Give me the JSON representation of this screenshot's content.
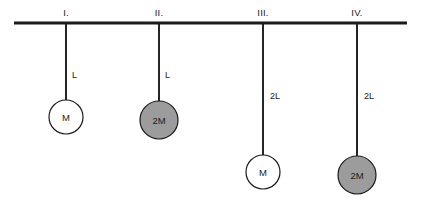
{
  "diagram": {
    "background_color": "#ffffff",
    "line_color": "#1a1a1a",
    "bob_white_color": "#ffffff",
    "bob_gray_color": "#9c9c9c",
    "width": 423,
    "height": 204
  },
  "ceiling": {
    "label": "ceiling",
    "x_start": 14,
    "x_end": 407,
    "y": 23,
    "thickness": 3.2
  },
  "pendulums": [
    {
      "id": "I",
      "roman_label": "I.",
      "roman_label_x": 66,
      "roman_label_y": 16,
      "rod_x": 66,
      "rod_top_y": 23,
      "rod_bottom_y": 100,
      "length_label": "L",
      "length_label_x": 72,
      "length_label_y": 78,
      "bob_label": "M",
      "bob_cx": 66,
      "bob_cy": 117,
      "bob_r": 17,
      "bob_fill": "white"
    },
    {
      "id": "II",
      "roman_label": "II.",
      "roman_label_x": 159,
      "roman_label_y": 16,
      "rod_x": 159,
      "rod_top_y": 23,
      "rod_bottom_y": 101,
      "length_label": "L",
      "length_label_x": 165,
      "length_label_y": 78,
      "bob_label": "2M",
      "bob_cx": 159,
      "bob_cy": 120,
      "bob_r": 19,
      "bob_fill": "gray"
    },
    {
      "id": "III",
      "roman_label": "III.",
      "roman_label_x": 263,
      "roman_label_y": 16,
      "rod_x": 263,
      "rod_top_y": 23,
      "rod_bottom_y": 155,
      "length_label": "2L",
      "length_label_x": 270,
      "length_label_y": 99,
      "bob_label": "M",
      "bob_cx": 263,
      "bob_cy": 172,
      "bob_r": 17,
      "bob_fill": "white"
    },
    {
      "id": "IV",
      "roman_label": "IV.",
      "roman_label_x": 357,
      "roman_label_y": 16,
      "rod_x": 357,
      "rod_top_y": 23,
      "rod_bottom_y": 156,
      "length_label": "2L",
      "length_label_x": 364,
      "length_label_y": 99,
      "bob_label": "2M",
      "bob_cx": 357,
      "bob_cy": 175,
      "bob_r": 19,
      "bob_fill": "gray"
    }
  ]
}
